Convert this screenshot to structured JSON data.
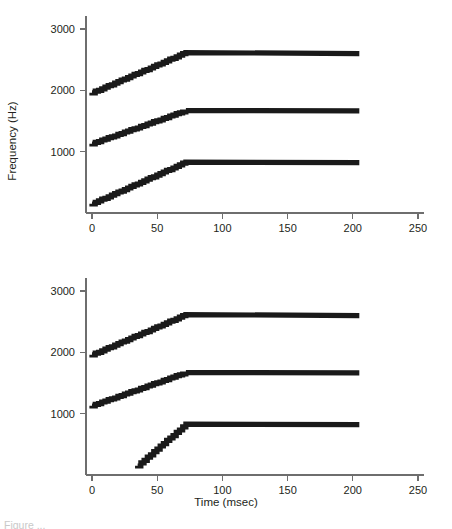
{
  "figure": {
    "y_axis_title": "Frequency (Hz)",
    "x_axis_title": "Time (msec)",
    "caption_partial": "Figure  ..."
  },
  "axes": {
    "x_ticks": [
      "0",
      "50",
      "100",
      "150",
      "200",
      "250"
    ],
    "y_ticks": [
      "1000",
      "2000",
      "3000"
    ]
  },
  "chart_data": [
    {
      "type": "line",
      "title": "",
      "panel": "top",
      "xlabel": "Time (msec)",
      "ylabel": "Frequency (Hz)",
      "xlim": [
        0,
        250
      ],
      "ylim": [
        0,
        3000
      ],
      "xticks": [
        0,
        50,
        100,
        150,
        200,
        250
      ],
      "yticks": [
        1000,
        2000,
        3000
      ],
      "grid": false,
      "legend": "none",
      "series": [
        {
          "name": "F3",
          "x": [
            0,
            72,
            205
          ],
          "values": [
            1960,
            2615,
            2600
          ]
        },
        {
          "name": "F2",
          "x": [
            0,
            72,
            205
          ],
          "values": [
            1130,
            1670,
            1665
          ]
        },
        {
          "name": "F1",
          "x": [
            0,
            72,
            205
          ],
          "values": [
            150,
            830,
            820
          ]
        }
      ]
    },
    {
      "type": "line",
      "title": "",
      "panel": "bottom",
      "xlabel": "Time (msec)",
      "ylabel": "Frequency (Hz)",
      "xlim": [
        0,
        250
      ],
      "ylim": [
        0,
        3000
      ],
      "xticks": [
        0,
        50,
        100,
        150,
        200,
        250
      ],
      "yticks": [
        1000,
        2000,
        3000
      ],
      "grid": false,
      "legend": "none",
      "series": [
        {
          "name": "F3",
          "x": [
            0,
            72,
            205
          ],
          "values": [
            1960,
            2615,
            2600
          ]
        },
        {
          "name": "F2",
          "x": [
            0,
            72,
            205
          ],
          "values": [
            1130,
            1670,
            1665
          ]
        },
        {
          "name": "F1",
          "x": [
            35,
            72,
            205
          ],
          "values": [
            150,
            830,
            820
          ]
        }
      ]
    }
  ]
}
